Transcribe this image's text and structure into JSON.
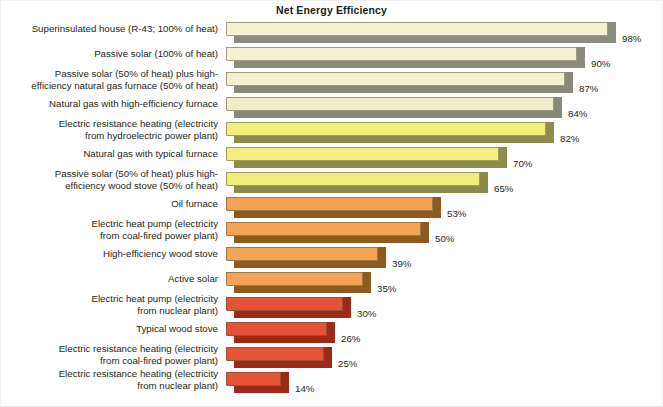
{
  "chart_data": {
    "type": "bar",
    "orientation": "horizontal",
    "title": "Net Energy Efficiency",
    "xlabel": "",
    "ylabel": "",
    "xlim": [
      0,
      100
    ],
    "grid": false,
    "legend": null,
    "value_suffix": "%",
    "categories": [
      "Superinsulated house (R-43; 100% of heat)",
      "Passive solar (100% of heat)",
      "Passive solar (50% of heat) plus high-\nefficiency natural gas furnace (50% of heat)",
      "Natural gas with high-efficiency furnace",
      "Electric resistance heating (electricity\nfrom hydroelectric power plant)",
      "Natural gas with typical furnace",
      "Passive solar (50% of heat) plus high-\nefficiency wood stove (50% of heat)",
      "Oil furnace",
      "Electric heat pump (electricity\nfrom coal-fired power plant)",
      "High-efficiency wood stove",
      "Active solar",
      "Electric heat pump (electricity\nfrom nuclear plant)",
      "Typical wood stove",
      "Electric resistance heating (electricity\nfrom coal-fired power plant)",
      "Electric resistance heating (electricity\nfrom nuclear plant)"
    ],
    "values": [
      98,
      90,
      87,
      84,
      82,
      70,
      65,
      53,
      50,
      39,
      35,
      30,
      26,
      25,
      14
    ],
    "value_labels": [
      "98%",
      "90%",
      "87%",
      "84%",
      "82%",
      "70%",
      "65%",
      "53%",
      "50%",
      "39%",
      "35%",
      "30%",
      "26%",
      "25%",
      "14%"
    ],
    "bar_colors_top": [
      "#F4F2D2",
      "#F4F2D2",
      "#F2F0CE",
      "#F0EEC8",
      "#F3EF7E",
      "#F3EF7E",
      "#F1ED7C",
      "#F2A355",
      "#F2A355",
      "#F2A355",
      "#F2A355",
      "#E55238",
      "#E55238",
      "#E55238",
      "#E55238"
    ],
    "bar_colors_side": [
      "#8C8C7E",
      "#8C8C7E",
      "#8A8A7C",
      "#88887A",
      "#8E8C4C",
      "#8E8C4C",
      "#8C8A4A",
      "#8D5A1F",
      "#8D5A1F",
      "#8D5A1F",
      "#8D5A1F",
      "#9E2A16",
      "#9E2A16",
      "#9E2A16",
      "#9E2A16"
    ]
  }
}
